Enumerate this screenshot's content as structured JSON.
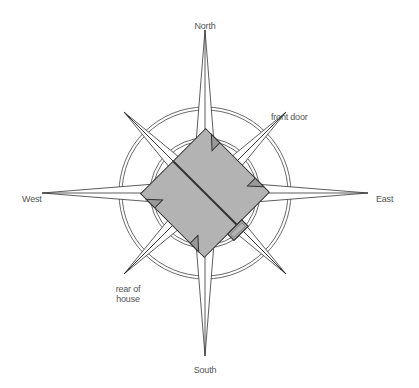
{
  "diagram": {
    "type": "compass-rose-house-orientation",
    "labels": {
      "north": "North",
      "south": "South",
      "east": "East",
      "west": "West",
      "front_door": "front door",
      "rear_line1": "rear of",
      "rear_line2": "house"
    },
    "colors": {
      "line": "#333333",
      "house_fill": "#b3b3b3",
      "label": "#555555",
      "background": "#ffffff"
    }
  }
}
